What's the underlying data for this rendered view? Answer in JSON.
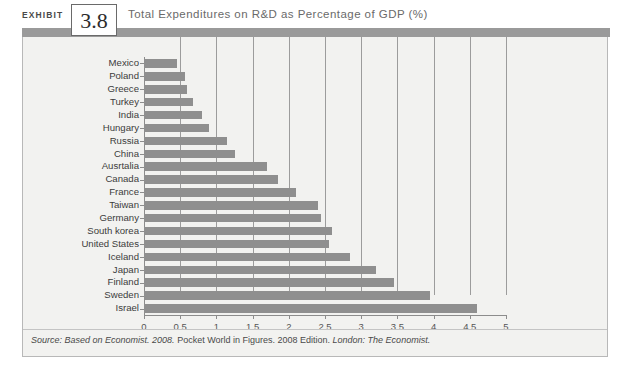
{
  "exhibit": {
    "label": "EXHIBIT",
    "number": "3.8",
    "title": "Total Expenditures on R&D as Percentage of GDP (%)",
    "accent_bar_color": "#9a9a9a",
    "panel_bg_color": "#f2f2f0",
    "bar_color": "#8f8f8f",
    "gridline_color": "#9c9c9c"
  },
  "source": {
    "prefix": "Source:",
    "italic_1": "Based on Economist. 2008.",
    "roman_1": "Pocket World in Figures. 2008 Edition.",
    "italic_2": "London: The Economist.",
    "full_text": "Source: Based on Economist. 2008. Pocket World in Figures. 2008 Edition. London: The Economist."
  },
  "chart_data": {
    "type": "bar",
    "orientation": "horizontal",
    "title": "Total Expenditures on R&D as Percentage of GDP (%)",
    "xlabel": "",
    "ylabel": "",
    "xlim": [
      0,
      5
    ],
    "xticks": [
      "0",
      "0.5",
      "1",
      "1.5",
      "2",
      "2.5",
      "3",
      "3.5",
      "4",
      "4.5",
      "5"
    ],
    "xtick_values": [
      0,
      0.5,
      1,
      1.5,
      2,
      2.5,
      3,
      3.5,
      4,
      4.5,
      5
    ],
    "grid": true,
    "grid_axis": "x",
    "legend": false,
    "categories": [
      "Mexico",
      "Poland",
      "Greece",
      "Turkey",
      "India",
      "Hungary",
      "Russia",
      "China",
      "Ausrtalia",
      "Canada",
      "France",
      "Taiwan",
      "Germany",
      "South korea",
      "United States",
      "Iceland",
      "Japan",
      "Finland",
      "Sweden",
      "Israel"
    ],
    "values": [
      0.45,
      0.57,
      0.6,
      0.68,
      0.8,
      0.9,
      1.15,
      1.25,
      1.7,
      1.85,
      2.1,
      2.4,
      2.45,
      2.6,
      2.55,
      2.85,
      3.2,
      3.45,
      3.95,
      4.6
    ],
    "units": "% of GDP"
  }
}
